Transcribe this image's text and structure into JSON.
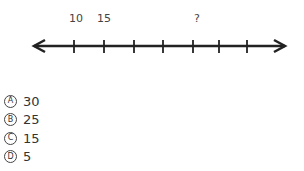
{
  "number_line": {
    "labels": [
      {
        "text": "10",
        "x": 69
      },
      {
        "text": "15",
        "x": 97
      },
      {
        "text": "?",
        "x": 194
      }
    ],
    "tick_count": 7
  },
  "choices": [
    {
      "letter": "A",
      "value": "30"
    },
    {
      "letter": "B",
      "value": "25"
    },
    {
      "letter": "C",
      "value": "15"
    },
    {
      "letter": "D",
      "value": "5"
    }
  ]
}
